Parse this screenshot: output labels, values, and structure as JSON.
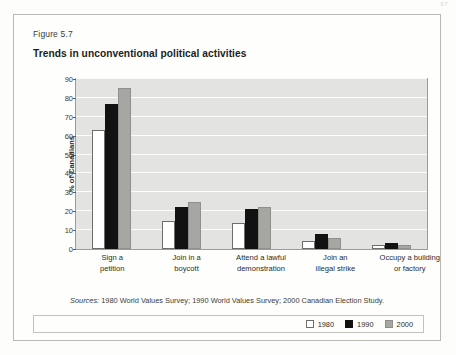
{
  "page": {
    "number": "97"
  },
  "figure": {
    "label": "Figure 5.7",
    "title": "Trends in unconventional political activities",
    "sources_lead": "Sources:",
    "sources_text": " 1980 World Values Survey; 1990 World Values Survey; 2000 Canadian Election Study."
  },
  "colors": {
    "series_1980": "#ffffff",
    "series_1990": "#121212",
    "series_2000": "#a6a6a3",
    "plot_background": "#e3e3e1",
    "gridline": "#fcfcfb",
    "axis": "#9b9b97"
  },
  "chart_data": {
    "type": "bar",
    "title": "Trends in unconventional political activities",
    "xlabel": "",
    "ylabel": "% of Canadians",
    "ylim": [
      0,
      90
    ],
    "yticks": [
      0,
      10,
      20,
      30,
      40,
      50,
      60,
      70,
      80,
      90
    ],
    "ytick_labels": [
      "0",
      "10",
      "20",
      "30",
      "40",
      "50",
      "60",
      "70",
      "80",
      "90"
    ],
    "grid": true,
    "legend_position": "bottom-right",
    "categories": [
      "Sign a petition",
      "Join in a boycott",
      "Attend a lawful demonstration",
      "Join an illegal strike",
      "Occupy a building or factory"
    ],
    "category_lines": [
      [
        "Sign a",
        "petition"
      ],
      [
        "Join in a",
        "boycott"
      ],
      [
        "Attend a lawful",
        "demonstration"
      ],
      [
        "Join an",
        "illegal strike"
      ],
      [
        "Occupy a building",
        "or factory"
      ]
    ],
    "series": [
      {
        "name": "1980",
        "values": [
          63,
          15,
          14,
          4,
          2
        ]
      },
      {
        "name": "1990",
        "values": [
          77,
          22,
          21,
          8,
          3
        ]
      },
      {
        "name": "2000",
        "values": [
          85,
          25,
          22,
          6,
          2
        ]
      }
    ]
  }
}
